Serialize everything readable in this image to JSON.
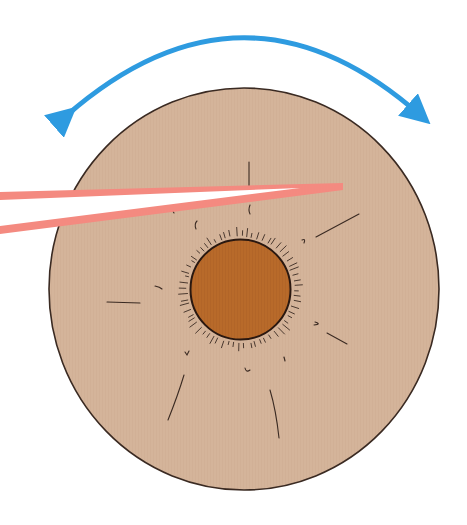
{
  "diagram": {
    "labels": [],
    "colors": {
      "background": "#ffffff",
      "sclera_disc": "#d4b49a",
      "disc_outline": "#3a2a22",
      "iris": "#b86a2a",
      "iris_outline": "#2a1810",
      "laser_beam": "#f48a80",
      "laser_core": "#ffffff",
      "rotation_arrow": "#2e9be0",
      "strokes": "#3a2a22"
    },
    "elements": [
      {
        "name": "rotation-arrow",
        "kind": "double-headed curved arrow",
        "meaning": "rotation"
      },
      {
        "name": "eye-disc",
        "kind": "large circle"
      },
      {
        "name": "iris",
        "kind": "small filled circle"
      },
      {
        "name": "laser-beam",
        "kind": "tapered beam entering from left"
      },
      {
        "name": "radial-marks",
        "kind": "fine hair-like strokes"
      }
    ]
  }
}
